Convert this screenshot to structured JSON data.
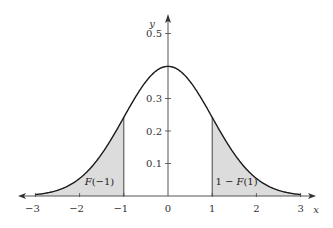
{
  "chart_data": {
    "type": "area",
    "title": "",
    "xlabel": "x",
    "ylabel": "y",
    "xlim": [
      -3,
      3
    ],
    "ylim": [
      0,
      0.5
    ],
    "x_ticks": [
      "−3",
      "−2",
      "−1",
      "0",
      "1",
      "2",
      "3"
    ],
    "y_ticks": [
      "0.1",
      "0.2",
      "0.3",
      "0.5"
    ],
    "grid": false,
    "series": [
      {
        "name": "standard normal pdf",
        "x": [
          -3,
          -2.5,
          -2,
          -1.5,
          -1,
          -0.5,
          0,
          0.5,
          1,
          1.5,
          2,
          2.5,
          3
        ],
        "values": [
          0.004,
          0.018,
          0.054,
          0.13,
          0.242,
          0.352,
          0.399,
          0.352,
          0.242,
          0.13,
          0.054,
          0.018,
          0.004
        ]
      }
    ],
    "shaded_regions": [
      {
        "from": -3,
        "to": -1,
        "label": "F(−1)"
      },
      {
        "from": 1,
        "to": 3,
        "label": "1 − F(1)"
      }
    ],
    "annotations": [
      {
        "text_italic": "F",
        "text_rest": "(−1)",
        "x": -1.55,
        "y": 0.035
      },
      {
        "text_pre": "1 − ",
        "text_italic": "F",
        "text_rest": "(1)",
        "x": 1.55,
        "y": 0.035
      }
    ]
  },
  "colors": {
    "curve": "#1a1a1a",
    "axis": "#555555",
    "shade": "#dcdcdc"
  }
}
